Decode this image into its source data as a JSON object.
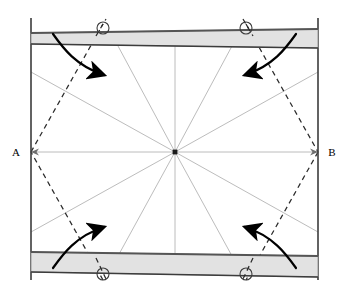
{
  "figure": {
    "background_color": "#ffffff",
    "width": 349,
    "height": 294,
    "labels": {
      "left_vertex": "A",
      "right_vertex": "B"
    },
    "colors": {
      "outline": "#3c3c3c",
      "bar_fill": "#e2e2e2",
      "bar_edge_dark": "#555555",
      "bar_edge_light": "#8c8c8c",
      "radial_line": "#b4b4b4",
      "dashed_line": "#2b2b2b",
      "arrow": "#000000",
      "center_dot": "#1a1a1a",
      "circle_marker": "#3c3c3c"
    },
    "geometry": {
      "frame": {
        "left": 31,
        "top": 18,
        "right": 318,
        "bottom": 280
      },
      "center": {
        "x": 175,
        "y": 152
      },
      "radial_line_count": 12,
      "hexagon_vertices": [
        {
          "x": 31,
          "y": 152
        },
        {
          "x": 103,
          "y": 28
        },
        {
          "x": 246,
          "y": 28
        },
        {
          "x": 318,
          "y": 152
        },
        {
          "x": 246,
          "y": 274
        },
        {
          "x": 103,
          "y": 274
        }
      ]
    },
    "bars": [
      {
        "name": "top-bar",
        "points": "31,33 318,29 318,48 31,44",
        "fill": "#e2e2e2"
      },
      {
        "name": "bottom-bar",
        "points": "31,252 318,256 318,277 31,272",
        "fill": "#e2e2e2"
      }
    ],
    "circle_markers": [
      {
        "name": "marker-top-left",
        "x": 103,
        "y": 28,
        "r": 6
      },
      {
        "name": "marker-top-right",
        "x": 246,
        "y": 28,
        "r": 6
      },
      {
        "name": "marker-bottom-left",
        "x": 103,
        "y": 274,
        "r": 6
      },
      {
        "name": "marker-bottom-right",
        "x": 246,
        "y": 274,
        "r": 6
      }
    ],
    "rotation_arrows": [
      {
        "name": "arrow-top-left",
        "direction": "clockwise-right"
      },
      {
        "name": "arrow-top-right",
        "direction": "counterclockwise-left"
      },
      {
        "name": "arrow-bottom-left",
        "direction": "clockwise-right"
      },
      {
        "name": "arrow-bottom-right",
        "direction": "counterclockwise-left"
      }
    ]
  }
}
